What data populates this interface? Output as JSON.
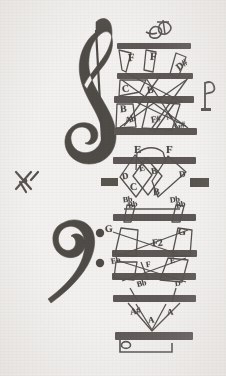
{
  "document": {
    "title": "Hand-drawn music staff diagram",
    "subtitle": "Scanned notation sheet with labelled pitches",
    "ink_color": "#4a4744",
    "bar_color": "#585450",
    "paper_color": "#f3f1ef"
  },
  "symbols": {
    "treble_clef": "treble-clef",
    "bass_clef": "bass-clef",
    "ornament_top": "turn-ornament",
    "fermata_right": "fermata-mark",
    "x_mark_left": "x-cross-mark",
    "block_left": "ink-block",
    "block_right": "ink-block",
    "whole_note_bottom": "whole-note",
    "bracket_bottom": "bracket"
  },
  "systems": [
    {
      "name": "treble-system",
      "clef": "treble-clef",
      "bar_count": 4,
      "notes": [
        {
          "label": "F",
          "x": 128,
          "y": 58
        },
        {
          "label": "F",
          "x": 150,
          "y": 57
        },
        {
          "label": "D#",
          "x": 180,
          "y": 66
        },
        {
          "label": "C",
          "x": 124,
          "y": 89
        },
        {
          "label": "B",
          "x": 148,
          "y": 90
        },
        {
          "label": "B",
          "x": 122,
          "y": 108
        },
        {
          "label": "Ab",
          "x": 128,
          "y": 120
        },
        {
          "label": "F#",
          "x": 155,
          "y": 120
        },
        {
          "label": "A",
          "x": 170,
          "y": 117
        },
        {
          "label": "G#",
          "x": 178,
          "y": 126
        }
      ]
    },
    {
      "name": "middle-system",
      "clef": "",
      "bar_count": 1,
      "notes": [
        {
          "label": "E",
          "x": 136,
          "y": 150
        },
        {
          "label": "F",
          "x": 168,
          "y": 150
        },
        {
          "label": "E",
          "x": 140,
          "y": 170
        },
        {
          "label": "D",
          "x": 124,
          "y": 178
        },
        {
          "label": "B",
          "x": 152,
          "y": 172
        },
        {
          "label": "D",
          "x": 180,
          "y": 174
        },
        {
          "label": "C",
          "x": 132,
          "y": 187
        },
        {
          "label": "B",
          "x": 155,
          "y": 192
        },
        {
          "label": "Bb",
          "x": 126,
          "y": 200
        },
        {
          "label": "Db",
          "x": 172,
          "y": 200
        }
      ]
    },
    {
      "name": "bass-system",
      "clef": "bass-clef",
      "bar_count": 4,
      "notes": [
        {
          "label": "Bb",
          "x": 130,
          "y": 207
        },
        {
          "label": "Bb",
          "x": 178,
          "y": 207
        },
        {
          "label": "G",
          "x": 107,
          "y": 228
        },
        {
          "label": "G",
          "x": 180,
          "y": 232
        },
        {
          "label": "F2",
          "x": 155,
          "y": 243
        },
        {
          "label": "Eb",
          "x": 113,
          "y": 262
        },
        {
          "label": "F",
          "x": 148,
          "y": 266
        },
        {
          "label": "E",
          "x": 172,
          "y": 262
        },
        {
          "label": "Bb",
          "x": 140,
          "y": 285
        },
        {
          "label": "D",
          "x": 176,
          "y": 284
        },
        {
          "label": "A#",
          "x": 133,
          "y": 312
        },
        {
          "label": "A",
          "x": 152,
          "y": 320
        },
        {
          "label": "A",
          "x": 170,
          "y": 312
        }
      ]
    }
  ]
}
